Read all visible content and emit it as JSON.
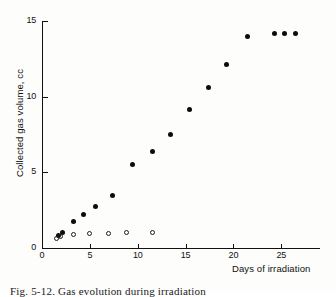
{
  "figure": {
    "caption": "Fig. 5-12.  Gas evolution during irradiation",
    "background_color": "#fdfdfc",
    "ink_color": "#111111"
  },
  "chart_data": {
    "type": "scatter",
    "title": "",
    "xlabel": "Days of irradiation",
    "ylabel": "Collected gas volume, cc",
    "xlim": [
      0,
      29
    ],
    "ylim": [
      0,
      15
    ],
    "xticks": [
      0,
      5,
      10,
      15,
      20,
      25
    ],
    "yticks": [
      0,
      5,
      10,
      15
    ],
    "xtick_labels": [
      "0",
      "5",
      "10",
      "15",
      "20",
      "25"
    ],
    "ytick_labels": [
      "0",
      "5",
      "10",
      "15"
    ],
    "grid": false,
    "legend": false,
    "legend_position": "none",
    "series": [
      {
        "name": "filled-circles",
        "marker": "filled circle",
        "color": "#0c0c0c",
        "x": [
          1.7,
          2.1,
          3.3,
          4.3,
          5.6,
          7.4,
          9.5,
          11.5,
          13.4,
          15.4,
          17.4,
          19.3,
          21.5,
          24.3,
          25.3,
          26.5
        ],
        "y": [
          0.85,
          1.0,
          1.75,
          2.2,
          2.75,
          3.45,
          5.5,
          6.4,
          7.5,
          9.15,
          10.6,
          12.15,
          13.95,
          14.2,
          14.2,
          14.2
        ]
      },
      {
        "name": "open-circles",
        "marker": "open circle",
        "color": "#1c1c1c",
        "x": [
          1.5,
          1.9,
          3.3,
          5.0,
          7.0,
          8.8,
          11.5
        ],
        "y": [
          0.65,
          0.75,
          0.9,
          0.95,
          0.95,
          1.05,
          1.05
        ]
      }
    ]
  }
}
